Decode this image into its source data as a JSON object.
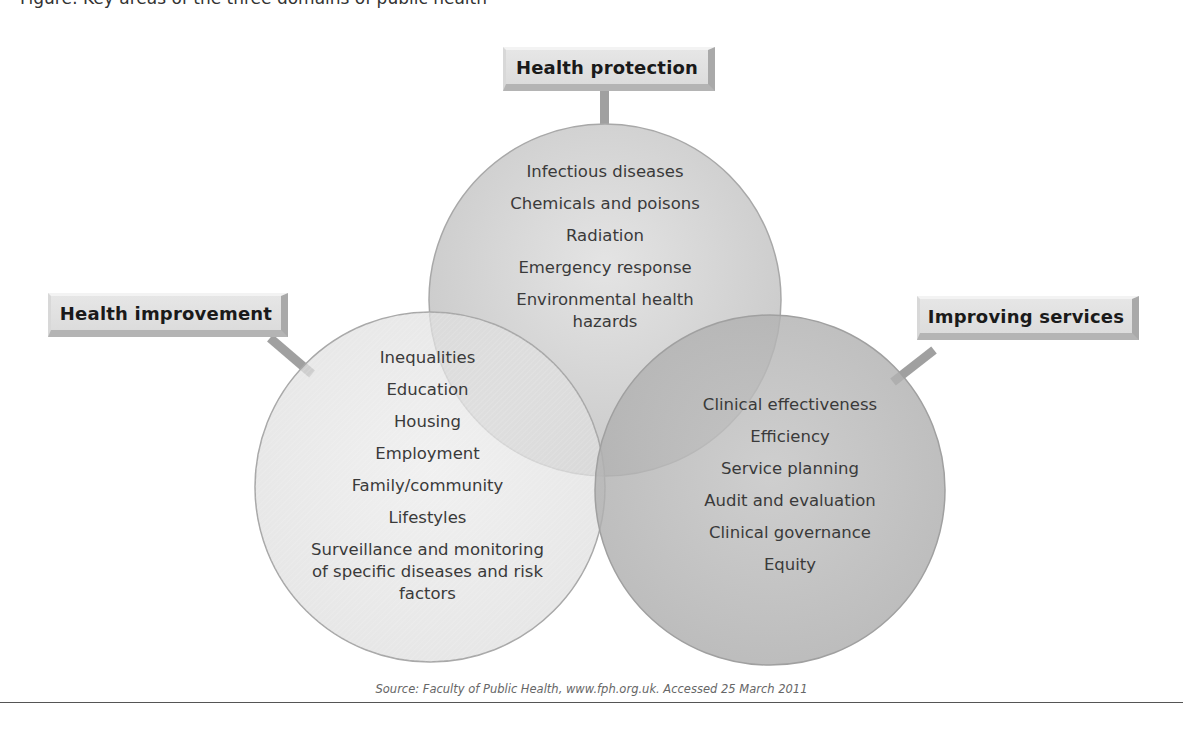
{
  "figure": {
    "caption_clipped": "Figure: Key areas of the three domains of public health",
    "source": "Source: Faculty of Public Health, www.fph.org.uk. Accessed 25 March 2011"
  },
  "domains": [
    {
      "id": "health-protection",
      "label": "Health protection",
      "items": [
        "Infectious diseases",
        "Chemicals and poisons",
        "Radiation",
        "Emergency response",
        "Environmental health hazards"
      ]
    },
    {
      "id": "health-improvement",
      "label": "Health improvement",
      "items": [
        "Inequalities",
        "Education",
        "Housing",
        "Employment",
        "Family/community",
        "Lifestyles",
        "Surveillance and monitoring of specific diseases and risk factors"
      ]
    },
    {
      "id": "improving-services",
      "label": "Improving services",
      "items": [
        "Clinical effectiveness",
        "Efficiency",
        "Service planning",
        "Audit and evaluation",
        "Clinical governance",
        "Equity"
      ]
    }
  ],
  "colors": {
    "top_circle": "#cfcfcf",
    "left_circle": "#e0e0e0",
    "right_circle": "#b5b5b5",
    "circle_edge": "#a8a8a8",
    "connector": "#a0a0a0"
  }
}
